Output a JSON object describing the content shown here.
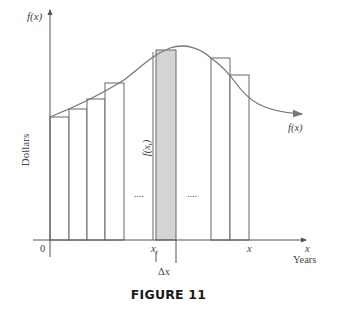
{
  "figure": {
    "caption": "FIGURE 11",
    "y_axis_label": "f(x)",
    "y_axis_title": "Dollars",
    "x_axis_label": "x",
    "x_axis_title": "Years",
    "origin_label": "0",
    "curve_label": "f(x)",
    "shaded_height_label": "f(x_t)",
    "shaded_height_label_main": "f(x",
    "shaded_height_label_sub": "t",
    "shaded_height_label_close": ")",
    "tick_xt_main": "x",
    "tick_xt_sub": "t",
    "tick_x": "x",
    "delta_label": "Δx",
    "ellipsis_left": "....",
    "ellipsis_right": "....",
    "colors": {
      "axis": "#555555",
      "curve": "#777777",
      "rect_stroke": "#666666",
      "shaded_fill": "#d4d4d4",
      "caption": "#1a1a1a"
    }
  },
  "diagram": {
    "rectangles_left": [
      {
        "x0": 50,
        "x1": 69,
        "top": 117
      },
      {
        "x0": 69,
        "x1": 87,
        "top": 109
      },
      {
        "x0": 87,
        "x1": 105,
        "top": 99
      },
      {
        "x0": 105,
        "x1": 124,
        "top": 83
      }
    ],
    "shaded_rectangle": {
      "x0": 156,
      "x1": 176,
      "top": 50
    },
    "rectangles_right": [
      {
        "x0": 211,
        "x1": 230,
        "top": 58
      },
      {
        "x0": 230,
        "x1": 249,
        "top": 75
      }
    ]
  }
}
